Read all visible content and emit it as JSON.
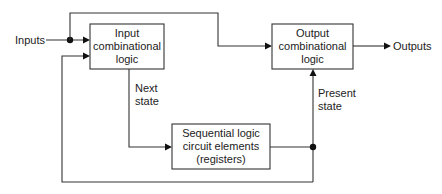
{
  "diagram": {
    "type": "sequential-logic-block-diagram",
    "colors": {
      "line": "#333333",
      "text": "#222222",
      "background": "#ffffff"
    },
    "blocks": {
      "input_logic": {
        "lines": [
          "Input",
          "combinational",
          "logic"
        ]
      },
      "output_logic": {
        "lines": [
          "Output",
          "combinational",
          "logic"
        ]
      },
      "sequential": {
        "lines": [
          "Sequential logic",
          "circuit elements",
          "(registers)"
        ]
      }
    },
    "labels": {
      "inputs": "Inputs",
      "outputs": "Outputs",
      "next_state": [
        "Next",
        "state"
      ],
      "present_state": [
        "Present",
        "state"
      ]
    },
    "connections": [
      {
        "from": "Inputs",
        "to": "Input combinational logic"
      },
      {
        "from": "Inputs",
        "to": "Output combinational logic"
      },
      {
        "from": "Input combinational logic",
        "to": "Sequential logic circuit elements",
        "label": "Next state"
      },
      {
        "from": "Sequential logic circuit elements",
        "to": "Output combinational logic",
        "label": "Present state"
      },
      {
        "from": "Sequential logic circuit elements",
        "to": "Input combinational logic",
        "label": "feedback"
      },
      {
        "from": "Output combinational logic",
        "to": "Outputs"
      }
    ]
  }
}
